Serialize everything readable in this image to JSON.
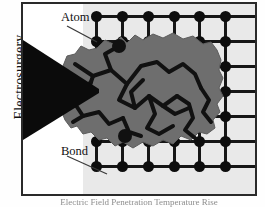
{
  "figure": {
    "axis_label": "Electrosurgery",
    "caption": "Electric Field Penetration Temperature Rise",
    "frame_color": "#2a2a2a",
    "lattice_bg_color": "#e9e9e9",
    "atom_color": "#0d0d0d",
    "bond_color": "#161616",
    "beam_color": "#0b0b0b",
    "blob_fill_color": "#6e6e6e",
    "blob_crack_color": "#111111"
  },
  "callouts": [
    {
      "id": "atom",
      "label": "Atom"
    },
    {
      "id": "bond",
      "label": "Bond"
    }
  ],
  "chart_data": {
    "type": "diagram",
    "ylabel": "Electrosurgery",
    "annotations": [
      "Atom",
      "Bond"
    ],
    "lattice": {
      "columns": 6,
      "rows": 7,
      "column_x": [
        73,
        99,
        125,
        151,
        176,
        202
      ],
      "row_y": [
        12,
        37,
        62,
        87,
        112,
        137,
        162
      ],
      "spacing_px": 25,
      "atom_radius_px": 5.5,
      "bond_width_px": 3,
      "row_line_extends_right": true
    },
    "beam": {
      "shape": "wedge",
      "apex_x": 76,
      "apex_y": 86,
      "base_top_y": 36,
      "base_bottom_y": 136
    },
    "damage_region": {
      "shape": "irregular-blob",
      "fill": "#6e6e6e",
      "internal_pattern": "branching cracks",
      "covers_lattice_center": true
    }
  }
}
